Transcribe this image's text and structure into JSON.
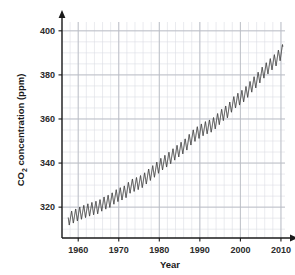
{
  "chart_data": {
    "type": "line",
    "title": "",
    "subtitle": "",
    "xlabel": "Year",
    "ylabel_prefix": "CO",
    "ylabel_sub": "2",
    "ylabel_suffix": " concentration (ppm)",
    "ylabel_full": "CO2 concentration (ppm)",
    "xlim": [
      1956,
      2011
    ],
    "ylim": [
      306,
      404
    ],
    "xticks": [
      1960,
      1970,
      1980,
      1990,
      2000,
      2010
    ],
    "xticklabels": [
      "1960",
      "1970",
      "1980",
      "1990",
      "2000",
      "2010"
    ],
    "yticks": [
      320,
      340,
      360,
      380,
      400
    ],
    "yticklabels": [
      "320",
      "340",
      "360",
      "380",
      "400"
    ],
    "minor_x_step": 2,
    "minor_y_step": 5,
    "grid": true,
    "grid_major_color": "#b9bcc4",
    "grid_minor_color": "#dcdee4",
    "legend": "none",
    "line_color": "#3a3a3a",
    "line_width": 1.0,
    "annotation": "Keeling Curve: monthly mean atmospheric CO2 with seasonal sawtooth oscillation superimposed on a rising trend.",
    "series": [
      {
        "name": "CO2 concentration (ppm)",
        "description": "Monthly mean atmospheric CO2, annual trend values at mid-year",
        "x": [
          1958,
          1959,
          1960,
          1961,
          1962,
          1963,
          1964,
          1965,
          1966,
          1967,
          1968,
          1969,
          1970,
          1971,
          1972,
          1973,
          1974,
          1975,
          1976,
          1977,
          1978,
          1979,
          1980,
          1981,
          1982,
          1983,
          1984,
          1985,
          1986,
          1987,
          1988,
          1989,
          1990,
          1991,
          1992,
          1993,
          1994,
          1995,
          1996,
          1997,
          1998,
          1999,
          2000,
          2001,
          2002,
          2003,
          2004,
          2005,
          2006,
          2007,
          2008,
          2009,
          2010
        ],
        "values": [
          315.0,
          315.9,
          316.9,
          317.6,
          318.4,
          319.0,
          319.6,
          320.0,
          321.4,
          322.2,
          323.0,
          324.6,
          325.7,
          326.3,
          327.5,
          329.7,
          330.2,
          331.1,
          332.0,
          333.8,
          335.4,
          336.8,
          338.7,
          340.1,
          341.4,
          343.0,
          344.6,
          346.0,
          347.4,
          349.2,
          351.6,
          353.1,
          354.4,
          355.6,
          356.4,
          357.1,
          358.8,
          360.8,
          362.6,
          363.7,
          366.6,
          368.3,
          369.5,
          371.0,
          373.2,
          375.6,
          377.4,
          379.8,
          381.9,
          383.8,
          385.6,
          387.4,
          389.9
        ],
        "seasonal_amplitude_ppm": 6.0,
        "seasonal_peak_month": 5,
        "end_value_ppm": 397.5,
        "start_value_ppm": 313.5
      }
    ]
  },
  "axes": {
    "x_arrow": true,
    "y_arrow": true,
    "axis_color": "#1a1a1a"
  }
}
